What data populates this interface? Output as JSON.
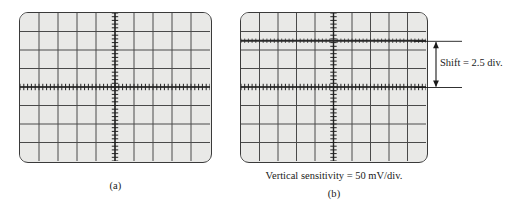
{
  "figure": {
    "panels": [
      {
        "id": "a",
        "caption": "(a)",
        "screen": {
          "name": "oscilloscope-screen",
          "bg_color": "#e9e9e7",
          "border_color": "#3a3a3a",
          "divisions_x": 10,
          "divisions_y": 8,
          "grid_color": "#4a4a4a",
          "axis_color": "#222222",
          "has_center_axes": true,
          "center_axis_ticks_per_div": 5,
          "trace": {
            "present": true,
            "type": "horizontal-line",
            "offset_divisions": 0,
            "description": "Trace on center horizontal axis (zero reference)"
          }
        }
      },
      {
        "id": "b",
        "caption": "(b)",
        "screen": {
          "name": "oscilloscope-screen",
          "bg_color": "#e9e9e7",
          "border_color": "#3a3a3a",
          "divisions_x": 10,
          "divisions_y": 8,
          "grid_color": "#4a4a4a",
          "axis_color": "#222222",
          "has_center_axes": true,
          "center_axis_ticks_per_div": 5,
          "trace": {
            "present": true,
            "type": "horizontal-line",
            "offset_divisions": 2.5,
            "description": "Trace shifted 2.5 divisions above center horizontal axis"
          }
        }
      }
    ],
    "annotations": {
      "shift_label": "Shift = 2.5 div.",
      "shift_value": 2.5,
      "shift_units": "div.",
      "dimension_arrow": "double-headed-vertical"
    },
    "notes": {
      "vertical_sensitivity": "Vertical sensitivity = 50 mV/div.",
      "vertical_sensitivity_value": 50,
      "vertical_sensitivity_units": "mV/div."
    }
  },
  "chart_data": {
    "type": "line",
    "title": "",
    "xlabel": "",
    "ylabel": "",
    "panels": [
      {
        "name": "(a)",
        "grid": {
          "x_divisions": 10,
          "y_divisions": 8
        },
        "xlim": [
          -5,
          5
        ],
        "ylim": [
          -4,
          4
        ],
        "series": [
          {
            "name": "trace-a",
            "type": "horizontal-line",
            "y_divisions": 0,
            "y_millivolts": 0
          }
        ]
      },
      {
        "name": "(b)",
        "grid": {
          "x_divisions": 10,
          "y_divisions": 8
        },
        "xlim": [
          -5,
          5
        ],
        "ylim": [
          -4,
          4
        ],
        "series": [
          {
            "name": "trace-b",
            "type": "horizontal-line",
            "y_divisions": 2.5,
            "y_millivolts": 125
          }
        ]
      }
    ],
    "scale": {
      "vertical_sensitivity_mv_per_div": 50
    },
    "annotations": [
      {
        "text": "Shift = 2.5 div.",
        "target_panel": "(b)",
        "value": 2.5,
        "units": "div."
      },
      {
        "text": "Vertical sensitivity = 50 mV/div.",
        "value": 50,
        "units": "mV/div."
      }
    ]
  }
}
